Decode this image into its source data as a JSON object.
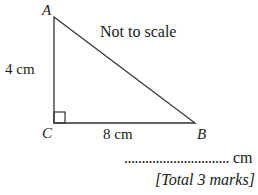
{
  "figure": {
    "note": "Not to scale",
    "vertices": {
      "A": {
        "label": "A",
        "x": 54,
        "y": 17
      },
      "B": {
        "label": "B",
        "x": 195,
        "y": 123
      },
      "C": {
        "label": "C",
        "x": 54,
        "y": 123
      }
    },
    "sides": {
      "AC": "4 cm",
      "CB": "8 cm"
    },
    "right_angle_at": "C",
    "line_color": "#333333"
  },
  "answer": {
    "blank": "..............................",
    "unit": "cm"
  },
  "marks": "[Total 3 marks]"
}
